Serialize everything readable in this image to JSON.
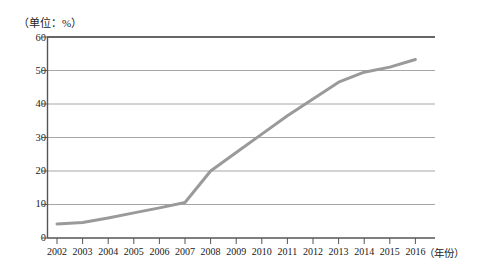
{
  "chart_data": {
    "type": "line",
    "title": "",
    "subtitle": "",
    "unit_note": "（单位：%）",
    "xlabel": "（年份）",
    "ylabel": "",
    "categories": [
      "2002",
      "2003",
      "2004",
      "2005",
      "2006",
      "2007",
      "2008",
      "2009",
      "2010",
      "2011",
      "2012",
      "2013",
      "2014",
      "2015",
      "2016"
    ],
    "values": [
      4.2,
      4.6,
      6.0,
      7.5,
      9.0,
      10.6,
      20.0,
      25.5,
      31.0,
      36.5,
      41.5,
      46.5,
      49.5,
      51.0,
      53.3
    ],
    "series": [
      {
        "name": "",
        "values": [
          4.2,
          4.6,
          6.0,
          7.5,
          9.0,
          10.6,
          20.0,
          25.5,
          31.0,
          36.5,
          41.5,
          46.5,
          49.5,
          51.0,
          53.3
        ],
        "color": "#9a9a9a"
      }
    ],
    "ylim": [
      0,
      60
    ],
    "yticks": [
      0,
      10,
      20,
      30,
      40,
      50,
      60
    ],
    "ytick_labels": [
      "0",
      "10",
      "20",
      "30",
      "40",
      "50",
      "60"
    ],
    "grid": true,
    "grid_color": "#a6a6a6",
    "legend": false,
    "legend_position": "none",
    "markers": false,
    "line_width": 3,
    "axis_color": "#4d4d4d",
    "background": "#ffffff"
  }
}
